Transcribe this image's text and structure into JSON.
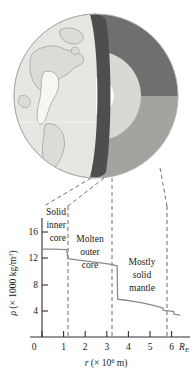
{
  "figure": {
    "title_alt": "Earth interior cutaway with density versus radius graph",
    "globe": {
      "name": "earth-cutaway",
      "layers": [
        {
          "name": "inner-core",
          "label": "Solid inner core",
          "color": "#fdfdfb"
        },
        {
          "name": "outer-core",
          "label": "Molten outer core",
          "color": "#d8d8d2"
        },
        {
          "name": "lower-mantle",
          "label": "Mostly solid mantle (upper quadrant)",
          "color": "#6e6e6e"
        },
        {
          "name": "upper-mantle",
          "label": "Mostly solid mantle (lower quadrant)",
          "color": "#a0a09c"
        },
        {
          "name": "crust-edge",
          "label": "Cut face",
          "color": "#4a4a4a"
        },
        {
          "name": "surface",
          "label": "Earth surface with continents",
          "color": "#e4e4e0"
        }
      ]
    },
    "leaders": {
      "name": "leader-lines",
      "count": 4,
      "style": "dashed",
      "color": "#6a6a6a"
    }
  },
  "chart_data": {
    "type": "line",
    "title": "",
    "xlabel": "r (× 10⁶ m)",
    "ylabel": "ρ (× 1000 kg/m³)",
    "xlim": [
      0,
      6.7
    ],
    "ylim": [
      0,
      18
    ],
    "grid": false,
    "legend": false,
    "x_ticks": [
      0,
      1,
      2,
      3,
      4,
      5,
      6
    ],
    "x_tick_labels": [
      "0",
      "1",
      "2",
      "3",
      "4",
      "5",
      "6"
    ],
    "x_end_label": "R_E",
    "x_end_value": 6.37,
    "y_ticks": [
      4,
      8,
      12,
      16
    ],
    "y_tick_labels": [
      "4",
      "8",
      "12",
      "16"
    ],
    "series": [
      {
        "name": "density",
        "color": "#8a8a8a",
        "points": [
          [
            0.0,
            13.4
          ],
          [
            0.4,
            13.4
          ],
          [
            0.8,
            13.35
          ],
          [
            1.15,
            13.3
          ],
          [
            1.2,
            11.95
          ],
          [
            1.6,
            11.75
          ],
          [
            2.0,
            11.6
          ],
          [
            2.4,
            11.42
          ],
          [
            2.8,
            11.25
          ],
          [
            3.2,
            11.05
          ],
          [
            3.48,
            10.85
          ],
          [
            3.5,
            5.75
          ],
          [
            3.9,
            5.6
          ],
          [
            4.3,
            5.4
          ],
          [
            4.7,
            5.15
          ],
          [
            5.1,
            4.85
          ],
          [
            5.45,
            4.55
          ],
          [
            5.6,
            4.4
          ],
          [
            5.62,
            4.05
          ],
          [
            5.95,
            3.95
          ],
          [
            6.1,
            3.85
          ],
          [
            6.12,
            3.45
          ],
          [
            6.3,
            3.4
          ],
          [
            6.37,
            3.35
          ]
        ]
      }
    ],
    "discontinuities": [
      {
        "r": 1.2,
        "from": 13.3,
        "to": 11.95,
        "name": "inner-outer-core-boundary"
      },
      {
        "r": 3.5,
        "from": 10.85,
        "to": 5.75,
        "name": "core-mantle-boundary"
      },
      {
        "r": 5.62,
        "from": 4.4,
        "to": 4.05,
        "name": "lower-upper-mantle-step"
      },
      {
        "r": 6.12,
        "from": 3.85,
        "to": 3.45,
        "name": "upper-mantle-step"
      }
    ],
    "region_boundaries": [
      1.2,
      3.5,
      6.37
    ],
    "annotations": [
      {
        "name": "region-label-inner-core",
        "lines": [
          "Solid",
          "inner",
          "core"
        ],
        "r_center": 0.62,
        "align": "right"
      },
      {
        "name": "region-label-outer-core",
        "lines": [
          "Molten",
          "outer",
          "core"
        ],
        "r_center": 2.35,
        "align": "center"
      },
      {
        "name": "region-label-mantle",
        "lines": [
          "Mostly",
          "solid",
          "mantle"
        ],
        "r_center": 4.95,
        "align": "center"
      }
    ]
  }
}
